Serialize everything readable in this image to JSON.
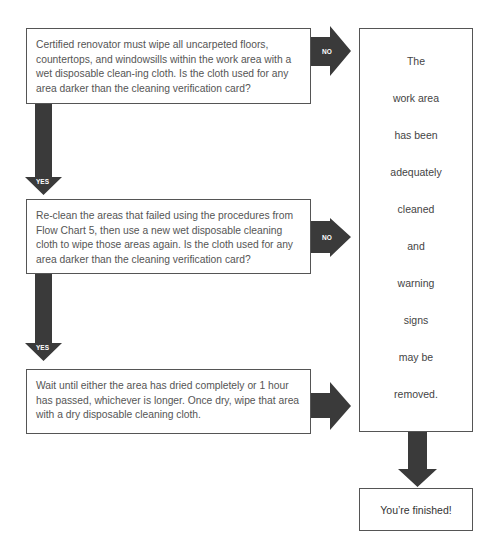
{
  "steps": [
    {
      "text": "Certified renovator must wipe all uncarpeted floors, countertops, and windowsills within the work area with a wet disposable clean-ing cloth. Is the cloth used for any area darker than the cleaning verification card?"
    },
    {
      "text": "Re-clean the areas that failed using the procedures from Flow Chart 5, then use a new wet disposable cleaning cloth to wipe those areas again. Is the cloth used for any area darker than the cleaning verification card?"
    },
    {
      "text": "Wait until either the area has dried completely or 1 hour has passed, whichever is longer. Once dry, wipe that area with a dry disposable cleaning cloth."
    }
  ],
  "result": {
    "lines": [
      "The",
      "work area",
      "has been",
      "adequately",
      "cleaned",
      "and",
      "warning",
      "signs",
      "may be",
      "removed."
    ]
  },
  "finish": {
    "text": "You’re finished!"
  },
  "arrows": {
    "no_label": "NO",
    "yes_label": "YES"
  },
  "colors": {
    "arrow": "#3a3a3a",
    "border": "#555555"
  }
}
